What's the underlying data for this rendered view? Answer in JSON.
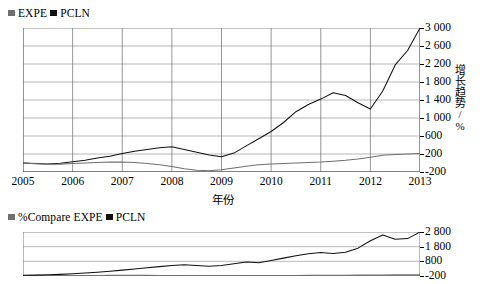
{
  "main": {
    "legend": [
      {
        "name": "EXPE",
        "color": "#6f6f6f"
      },
      {
        "name": "PCLN",
        "color": "#111111"
      }
    ],
    "legend_label_0": "EXPE",
    "legend_label_1": "PCLN",
    "xtitle": "年份",
    "ytitle": "增长趋势/%"
  },
  "sub": {
    "legend_label_0": "%Compare EXPE",
    "legend_label_1": "PCLN"
  },
  "chart_data": [
    {
      "id": "main",
      "type": "line",
      "title": "",
      "xlabel": "年份",
      "ylabel": "增长趋势/%",
      "xlim": [
        2005,
        2013
      ],
      "ylim": [
        -200,
        3000
      ],
      "yticks": [
        -200,
        200,
        600,
        1000,
        1400,
        1800,
        2200,
        2600,
        3000
      ],
      "ytick_labels": [
        "-200",
        "200",
        "600",
        "1 000",
        "1 400",
        "1 800",
        "2 200",
        "2 600",
        "3 000"
      ],
      "xticks": [
        2005,
        2006,
        2007,
        2008,
        2009,
        2010,
        2011,
        2012,
        2013
      ],
      "xtick_labels": [
        "2005",
        "2006",
        "2007",
        "2008",
        "2009",
        "2010",
        "2011",
        "2012",
        "2013"
      ],
      "grid": true,
      "legend_position": "top-left",
      "series": [
        {
          "name": "PCLN",
          "color": "#111111",
          "x": [
            2005.0,
            2005.25,
            2005.5,
            2005.75,
            2006.0,
            2006.25,
            2006.5,
            2006.75,
            2007.0,
            2007.25,
            2007.5,
            2007.75,
            2008.0,
            2008.25,
            2008.5,
            2008.75,
            2009.0,
            2009.25,
            2009.5,
            2009.75,
            2010.0,
            2010.25,
            2010.5,
            2010.75,
            2011.0,
            2011.25,
            2011.5,
            2011.75,
            2012.0,
            2012.25,
            2012.5,
            2012.75,
            2013.0
          ],
          "values": [
            0,
            -10,
            -20,
            -5,
            30,
            60,
            110,
            150,
            210,
            260,
            300,
            340,
            360,
            300,
            240,
            180,
            140,
            220,
            380,
            540,
            700,
            900,
            1140,
            1300,
            1420,
            1560,
            1500,
            1340,
            1200,
            1600,
            2180,
            2500,
            3000
          ]
        },
        {
          "name": "EXPE",
          "color": "#6f6f6f",
          "x": [
            2005.0,
            2005.25,
            2005.5,
            2005.75,
            2006.0,
            2006.25,
            2006.5,
            2006.75,
            2007.0,
            2007.25,
            2007.5,
            2007.75,
            2008.0,
            2008.25,
            2008.5,
            2008.75,
            2009.0,
            2009.25,
            2009.5,
            2009.75,
            2010.0,
            2010.25,
            2010.5,
            2010.75,
            2011.0,
            2011.25,
            2011.5,
            2011.75,
            2012.0,
            2012.25,
            2012.5,
            2012.75,
            2013.0
          ],
          "values": [
            0,
            -15,
            -30,
            -25,
            -10,
            0,
            10,
            20,
            20,
            10,
            -10,
            -40,
            -80,
            -130,
            -160,
            -170,
            -150,
            -110,
            -70,
            -40,
            -20,
            -10,
            0,
            10,
            20,
            40,
            60,
            90,
            130,
            170,
            190,
            200,
            210
          ]
        }
      ]
    },
    {
      "id": "sub",
      "type": "line",
      "title": "",
      "xlabel": "",
      "ylabel": "",
      "xlim": [
        2005,
        2013
      ],
      "ylim": [
        -200,
        2800
      ],
      "yticks": [
        -200,
        800,
        1800,
        2800
      ],
      "ytick_labels": [
        "-200",
        "800",
        "1 800",
        "2 800"
      ],
      "grid": true,
      "legend_position": "top-left",
      "series": [
        {
          "name": "%Compare EXPE",
          "color": "#6f6f6f",
          "x": [
            2005.0,
            2005.25,
            2005.5,
            2005.75,
            2006.0,
            2006.25,
            2006.5,
            2006.75,
            2007.0,
            2007.25,
            2007.5,
            2007.75,
            2008.0,
            2008.25,
            2008.5,
            2008.75,
            2009.0,
            2009.25,
            2009.5,
            2009.75,
            2010.0,
            2010.25,
            2010.5,
            2010.75,
            2011.0,
            2011.25,
            2011.5,
            2011.75,
            2012.0,
            2012.25,
            2012.5,
            2012.75,
            2013.0
          ],
          "values": [
            -170,
            -175,
            -180,
            -178,
            -170,
            -165,
            -160,
            -155,
            -150,
            -152,
            -158,
            -165,
            -172,
            -178,
            -182,
            -184,
            -182,
            -178,
            -172,
            -168,
            -165,
            -162,
            -160,
            -158,
            -155,
            -150,
            -145,
            -140,
            -132,
            -125,
            -120,
            -118,
            -115
          ]
        },
        {
          "name": "PCLN",
          "color": "#111111",
          "x": [
            2005.0,
            2005.25,
            2005.5,
            2005.75,
            2006.0,
            2006.25,
            2006.5,
            2006.75,
            2007.0,
            2007.25,
            2007.5,
            2007.75,
            2008.0,
            2008.25,
            2008.5,
            2008.75,
            2009.0,
            2009.25,
            2009.5,
            2009.75,
            2010.0,
            2010.25,
            2010.5,
            2010.75,
            2011.0,
            2011.25,
            2011.5,
            2011.75,
            2012.0,
            2012.25,
            2012.5,
            2012.75,
            2013.0
          ],
          "values": [
            -150,
            -140,
            -120,
            -90,
            -50,
            0,
            60,
            130,
            200,
            280,
            360,
            440,
            520,
            560,
            520,
            470,
            520,
            640,
            760,
            700,
            860,
            1020,
            1180,
            1320,
            1400,
            1340,
            1420,
            1700,
            2200,
            2600,
            2300,
            2350,
            2800
          ]
        }
      ]
    }
  ]
}
